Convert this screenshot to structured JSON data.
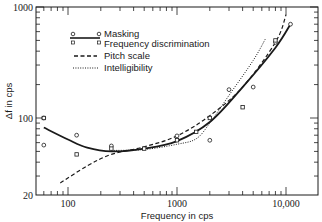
{
  "chart_data": {
    "type": "line",
    "title": "",
    "xlabel": "Frequency in cps",
    "ylabel": "Δf in cps",
    "xscale": "log",
    "yscale": "log",
    "xlim": [
      60,
      16000
    ],
    "ylim": [
      20,
      1000
    ],
    "grid": false,
    "legend_position": "upper left",
    "x_tick_labels": [
      "100",
      "1000",
      "10,000"
    ],
    "y_tick_labels": [
      "20",
      "100",
      "1000"
    ],
    "series": [
      {
        "name": "Masking",
        "style": "solid line with circle markers",
        "curve": [
          [
            60,
            82
          ],
          [
            100,
            64
          ],
          [
            150,
            54
          ],
          [
            250,
            50
          ],
          [
            500,
            53
          ],
          [
            1000,
            62
          ],
          [
            2000,
            92
          ],
          [
            4000,
            190
          ],
          [
            8000,
            430
          ],
          [
            11000,
            700
          ]
        ],
        "points": [
          [
            60,
            100
          ],
          [
            60,
            57
          ],
          [
            120,
            70
          ],
          [
            250,
            56
          ],
          [
            1000,
            69
          ],
          [
            2000,
            63
          ],
          [
            3000,
            180
          ],
          [
            5000,
            190
          ],
          [
            8000,
            480
          ],
          [
            11000,
            700
          ]
        ]
      },
      {
        "name": "Frequency discrimination",
        "style": "square markers",
        "points": [
          [
            60,
            100
          ],
          [
            120,
            47
          ],
          [
            250,
            53
          ],
          [
            500,
            53
          ],
          [
            1000,
            63
          ],
          [
            1500,
            75
          ],
          [
            2000,
            100
          ],
          [
            4000,
            125
          ],
          [
            8000,
            500
          ]
        ]
      },
      {
        "name": "Pitch scale",
        "style": "dashed line",
        "curve": [
          [
            85,
            26
          ],
          [
            150,
            37
          ],
          [
            250,
            47
          ],
          [
            500,
            55
          ],
          [
            1000,
            69
          ],
          [
            2000,
            105
          ],
          [
            4000,
            190
          ],
          [
            8000,
            480
          ],
          [
            10000,
            850
          ]
        ]
      },
      {
        "name": "Intelligibility",
        "style": "dotted line",
        "curve": [
          [
            250,
            51
          ],
          [
            500,
            52
          ],
          [
            1000,
            58
          ],
          [
            1500,
            65
          ],
          [
            2000,
            90
          ],
          [
            3000,
            160
          ],
          [
            5000,
            330
          ],
          [
            6500,
            520
          ]
        ]
      }
    ]
  },
  "legend": {
    "items": [
      {
        "label": "Masking"
      },
      {
        "label": "Frequency discrimination"
      },
      {
        "label": "Pitch scale"
      },
      {
        "label": "Intelligibility"
      }
    ]
  },
  "axes": {
    "x_title": "Frequency in cps",
    "y_title": "Δf in cps",
    "x_ticks": {
      "t100": "100",
      "t1000": "1000",
      "t10000": "10,000"
    },
    "y_ticks": {
      "t20": "20",
      "t100": "100",
      "t1000": "1000"
    }
  }
}
